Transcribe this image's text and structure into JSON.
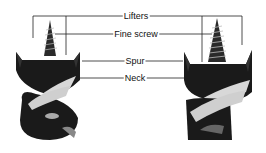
{
  "diagram": {
    "labels": [
      {
        "id": "lifters",
        "text": "Lifters"
      },
      {
        "id": "fine_screw",
        "text": "Fine screw"
      },
      {
        "id": "spur",
        "text": "Spur"
      },
      {
        "id": "neck",
        "text": "Neck"
      }
    ],
    "colors": {
      "line": "#222222",
      "bit": "#1a1a1a",
      "highlight": "#d8d8d8",
      "background": "#ffffff"
    }
  }
}
